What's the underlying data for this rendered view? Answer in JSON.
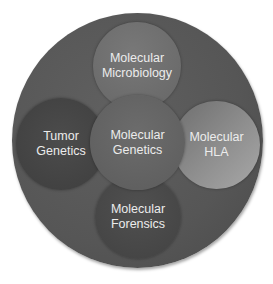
{
  "diagram": {
    "type": "venn-cluster",
    "outer_circle": {
      "color": "#575757"
    },
    "nodes": {
      "top": {
        "line1": "Molecular",
        "line2": "Microbiology",
        "color": "#707070"
      },
      "left": {
        "line1": "Tumor",
        "line2": "Genetics",
        "color": "#474747"
      },
      "center": {
        "line1": "Molecular",
        "line2": "Genetics",
        "color": "#656565"
      },
      "right": {
        "line1": "Molecular",
        "line2": "HLA",
        "color": "#8c8c8c"
      },
      "bottom": {
        "line1": "Molecular",
        "line2": "Forensics",
        "color": "#4a4a4a"
      }
    },
    "text_color": "#ececec"
  }
}
